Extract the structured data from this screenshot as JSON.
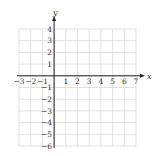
{
  "chart_data": {
    "type": "scatter",
    "title": "",
    "xlabel": "x",
    "ylabel": "y",
    "xlim": [
      -3,
      7
    ],
    "ylim": [
      -6,
      4
    ],
    "grid": true,
    "x_ticks": [
      -3,
      -2,
      -1,
      1,
      2,
      3,
      4,
      5,
      6,
      7
    ],
    "y_ticks": [
      4,
      3,
      2,
      1,
      -1,
      -2,
      -3,
      -4,
      -5,
      -6
    ],
    "x_tick_labels": [
      "−3",
      "−2",
      "−1",
      "1",
      "2",
      "3",
      "4",
      "5",
      "6",
      "7"
    ],
    "y_tick_labels": [
      "4",
      "3",
      "2",
      "1",
      "−1",
      "−2",
      "−3",
      "−4",
      "−5",
      "−6"
    ],
    "points": [],
    "legend": []
  },
  "colors": {
    "grid": "#d9d9d9",
    "axis": "#222222",
    "text": "#333333",
    "background": "#ffffff"
  },
  "icons": {
    "x_arrow": "arrow-right-icon",
    "y_arrow": "arrow-up-icon"
  }
}
